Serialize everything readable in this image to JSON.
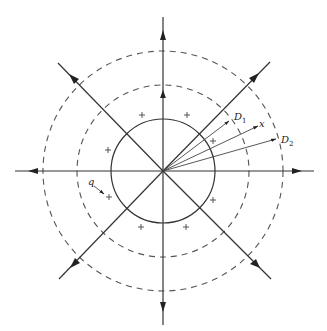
{
  "diagram": {
    "center": {
      "x": 163,
      "y": 171
    },
    "circles": [
      {
        "name": "inner",
        "style": "solid",
        "r": 52
      },
      {
        "name": "middle",
        "style": "dashed",
        "r": 86
      },
      {
        "name": "outer",
        "style": "dashed",
        "r": 120
      }
    ],
    "axes": [
      {
        "name": "up",
        "x2": 163,
        "y2": 17
      },
      {
        "name": "down",
        "x2": 163,
        "y2": 325
      },
      {
        "name": "left",
        "x2": 15,
        "y2": 171
      },
      {
        "name": "right",
        "x2": 314,
        "y2": 171
      },
      {
        "name": "upper-right",
        "x2": 270,
        "y2": 62
      },
      {
        "name": "upper-left",
        "x2": 58,
        "y2": 63
      },
      {
        "name": "lower-right",
        "x2": 271,
        "y2": 279
      },
      {
        "name": "lower-left",
        "x2": 59,
        "y2": 279
      }
    ],
    "vectors": [
      {
        "name": "D1",
        "x2": 229,
        "y2": 121
      },
      {
        "name": "x",
        "x2": 258,
        "y2": 126
      },
      {
        "name": "D2",
        "x2": 276,
        "y2": 139
      }
    ],
    "plus_marks": [
      {
        "x": 142,
        "y": 115
      },
      {
        "x": 187,
        "y": 115
      },
      {
        "x": 108,
        "y": 150
      },
      {
        "x": 109,
        "y": 197
      },
      {
        "x": 141,
        "y": 227
      },
      {
        "x": 186,
        "y": 227
      },
      {
        "x": 213,
        "y": 200
      },
      {
        "x": 213,
        "y": 141
      }
    ],
    "labels": {
      "d1_main": "D",
      "d1_sub": "1",
      "x_label": "x",
      "d2_main": "D",
      "d2_sub": "2",
      "q_label": "q"
    },
    "q_arrow": {
      "x1": 94,
      "y1": 186,
      "x2": 104,
      "y2": 194
    }
  }
}
